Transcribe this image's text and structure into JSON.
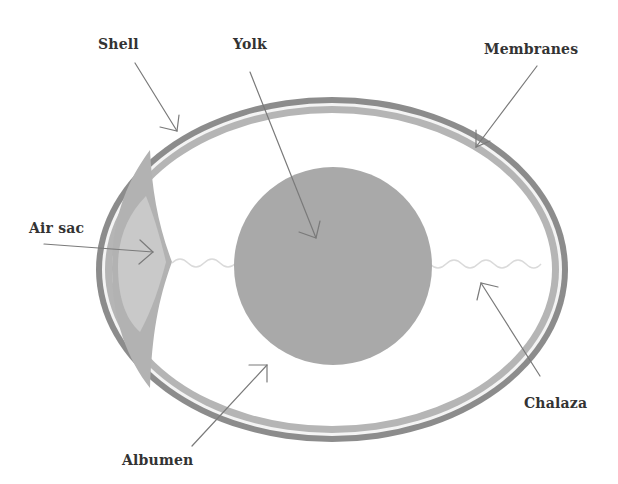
{
  "diagram": {
    "labels": {
      "shell": "Shell",
      "yolk": "Yolk",
      "membranes": "Membranes",
      "air_sac": "Air sac",
      "chalaza": "Chalaza",
      "albumen": "Albumen"
    },
    "colors": {
      "background": "#ffffff",
      "shell": "#8c8c8c",
      "membrane": "#b5b5b5",
      "membrane_gap": "#f2f2f2",
      "albumen": "#ffffff",
      "air_sac_outer": "#b0b0b0",
      "air_sac_inner": "#c8c8c8",
      "yolk": "#a9a9a9",
      "chalaza": "#dcdcdc",
      "pointer": "#7a7a7a",
      "label_text": "#333333"
    }
  }
}
